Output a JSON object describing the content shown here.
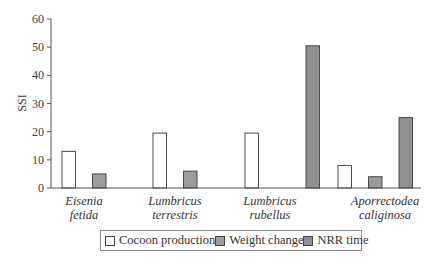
{
  "chart_data": {
    "type": "bar",
    "title": "",
    "xlabel": "",
    "ylabel": "SSI",
    "ylim": [
      0,
      60
    ],
    "yticks": [
      0,
      10,
      20,
      30,
      40,
      50,
      60
    ],
    "grid": false,
    "legend_position": "bottom",
    "categories": [
      [
        "Eisenia",
        "fetida"
      ],
      [
        "Lumbricus",
        "terrestris"
      ],
      [
        "Lumbricus",
        "rubellus"
      ],
      [
        "Aporrectodea",
        "caliginosa"
      ]
    ],
    "series": [
      {
        "name": "Cocoon production",
        "color": "#ffffff",
        "values": [
          13,
          19.5,
          19.5,
          8
        ]
      },
      {
        "name": "Weight change",
        "color": "#9c9c9c",
        "values": [
          5,
          6,
          null,
          4
        ]
      },
      {
        "name": "NRR time",
        "color": "#909090",
        "values": [
          null,
          null,
          50.5,
          25
        ]
      }
    ]
  },
  "legend": {
    "items": [
      {
        "label": "Cocoon production",
        "color": "#ffffff"
      },
      {
        "label": "Weight change",
        "color": "#9c9c9c"
      },
      {
        "label": "NRR time",
        "color": "#909090"
      }
    ]
  },
  "axis": {
    "ylabel": "SSI"
  }
}
